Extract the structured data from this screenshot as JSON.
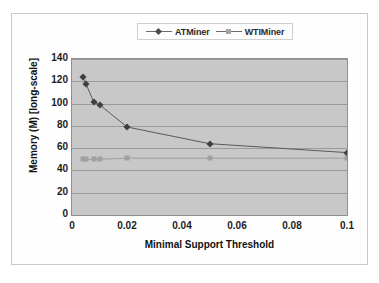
{
  "chart_data": {
    "type": "line",
    "title": "",
    "xlabel": "Minimal Support Threshold",
    "ylabel": "Memory (M) [long-scale]",
    "xlim": [
      0,
      0.1
    ],
    "ylim": [
      0,
      140
    ],
    "xticks": [
      "0",
      "0.02",
      "0.04",
      "0.06",
      "0.08",
      "0.1"
    ],
    "xtick_values": [
      0,
      0.02,
      0.04,
      0.06,
      0.08,
      0.1
    ],
    "yticks": [
      "0",
      "20",
      "40",
      "60",
      "80",
      "100",
      "120",
      "140"
    ],
    "ytick_values": [
      0,
      20,
      40,
      60,
      80,
      100,
      120,
      140
    ],
    "grid": "horizontal",
    "legend_position": "top-center",
    "plot_background": "#c8c8c8",
    "x": [
      0.004,
      0.005,
      0.008,
      0.01,
      0.02,
      0.05,
      0.1
    ],
    "series": [
      {
        "name": "ATMiner",
        "marker": "diamond",
        "color": "#3f3f3f",
        "values": [
          124,
          118,
          101,
          99,
          79,
          64,
          56
        ]
      },
      {
        "name": "WTIMiner",
        "marker": "square",
        "color": "#a0a0a0",
        "values": [
          50,
          50,
          50,
          50,
          51,
          51,
          51
        ]
      }
    ]
  },
  "legend": {
    "entries": [
      {
        "label": "ATMiner"
      },
      {
        "label": "WTIMiner"
      }
    ]
  },
  "axes": {
    "x_title": "Minimal Support Threshold",
    "y_title": "Memory (M) [long-scale]"
  }
}
